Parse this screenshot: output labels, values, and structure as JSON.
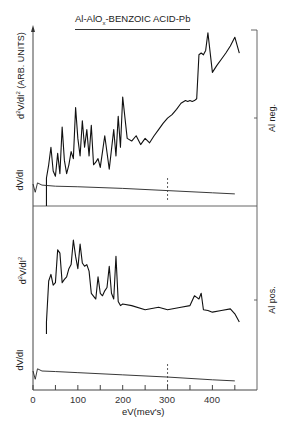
{
  "chart_data": {
    "type": "line",
    "title": "Al-AlOx-BENZOIC ACID-Pb",
    "xlabel": "eV(mev's)",
    "x_ticks": [
      0,
      100,
      200,
      300,
      400
    ],
    "x_minor_ticks": [
      50,
      150,
      250,
      350,
      450
    ],
    "xlim": [
      0,
      500
    ],
    "grid": false,
    "legend": null,
    "panels": [
      {
        "name": "Al neg.",
        "ylabel_upper": "d²V/dI² (ARB. UNITS)",
        "ylabel_lower": "dV/dI",
        "right_label": "Al neg.",
        "series": [
          {
            "name": "d2V/dI2",
            "x": [
              30,
              35,
              40,
              45,
              50,
              55,
              60,
              65,
              70,
              75,
              80,
              85,
              90,
              95,
              100,
              105,
              110,
              115,
              120,
              125,
              130,
              135,
              140,
              145,
              150,
              160,
              170,
              180,
              185,
              190,
              195,
              200,
              210,
              220,
              230,
              240,
              250,
              260,
              270,
              280,
              290,
              300,
              310,
              320,
              330,
              340,
              345,
              350,
              355,
              360,
              365,
              370,
              375,
              380,
              385,
              390,
              400,
              410,
              420,
              430,
              440,
              450,
              460
            ],
            "y": [
              0,
              15,
              35,
              8,
              2,
              28,
              5,
              58,
              20,
              5,
              15,
              30,
              22,
              80,
              45,
              25,
              65,
              35,
              55,
              25,
              60,
              15,
              18,
              22,
              12,
              48,
              10,
              55,
              25,
              70,
              35,
              92,
              45,
              42,
              48,
              38,
              45,
              40,
              48,
              55,
              62,
              68,
              72,
              78,
              85,
              88,
              87,
              88,
              87,
              88,
              90,
              140,
              142,
              140,
              145,
              165,
              120,
              128,
              135,
              142,
              150,
              160,
              142,
              138
            ]
          },
          {
            "name": "dV/dI",
            "x": [
              0,
              5,
              10,
              20,
              50,
              100,
              200,
              300,
              400,
              450
            ],
            "y": [
              20,
              5,
              22,
              18,
              16,
              15,
              12,
              8,
              4,
              2
            ]
          }
        ],
        "annotations": [
          {
            "type": "dashed-vline",
            "x": 300
          }
        ]
      },
      {
        "name": "Al pos.",
        "ylabel_upper": "d²V/dI²",
        "ylabel_lower": "dV/dI",
        "right_label": "Al pos.",
        "series": [
          {
            "name": "d2V/dI2",
            "x": [
              30,
              35,
              40,
              45,
              50,
              55,
              60,
              65,
              70,
              75,
              80,
              85,
              90,
              95,
              100,
              105,
              110,
              115,
              120,
              125,
              130,
              140,
              145,
              150,
              155,
              160,
              165,
              170,
              175,
              180,
              185,
              190,
              195,
              200,
              220,
              250,
              280,
              300,
              330,
              350,
              360,
              365,
              370,
              375,
              380,
              390,
              400,
              420,
              440,
              450,
              460
            ],
            "y": [
              0,
              50,
              58,
              45,
              48,
              88,
              84,
              48,
              52,
              55,
              65,
              70,
              100,
              80,
              65,
              95,
              72,
              68,
              70,
              62,
              35,
              28,
              55,
              35,
              32,
              38,
              42,
              68,
              35,
              28,
              80,
              25,
              20,
              22,
              20,
              15,
              18,
              15,
              18,
              20,
              32,
              30,
              28,
              35,
              15,
              14,
              12,
              14,
              16,
              10,
              0
            ]
          },
          {
            "name": "dV/dI",
            "x": [
              0,
              5,
              10,
              20,
              50,
              100,
              200,
              300,
              400,
              450
            ],
            "y": [
              20,
              5,
              24,
              20,
              19,
              17,
              13,
              9,
              4,
              2
            ]
          }
        ],
        "annotations": [
          {
            "type": "dashed-vline",
            "x": 300
          }
        ]
      }
    ]
  },
  "labels": {
    "title_main": "Al-AlO",
    "title_sub": "x",
    "title_rest": "-BENZOIC ACID-Pb",
    "top_ylabel_a": "d",
    "top_ylabel_sup1": "2",
    "top_ylabel_b": "V/dI",
    "top_ylabel_sup2": "2",
    "top_ylabel_c": " (ARB. UNITS)",
    "top_dvdi": "dV/dI",
    "top_right": "Al neg.",
    "bot_ylabel_a": "d",
    "bot_ylabel_sup1": "2",
    "bot_ylabel_b": "V/dI",
    "bot_ylabel_sup2": "2",
    "bot_dvdi": "dV/dI",
    "bot_right": "Al pos.",
    "xlabel": "eV(mev's)",
    "tick_0": "0",
    "tick_100": "100",
    "tick_200": "200",
    "tick_300": "300",
    "tick_400": "400"
  }
}
